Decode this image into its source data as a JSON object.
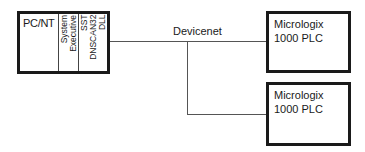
{
  "diagram": {
    "pc": {
      "title": "PC/NT",
      "column1": [
        "System",
        "Executive"
      ],
      "column2": [
        "SST",
        "DNSCAN32",
        "DLL"
      ]
    },
    "network": {
      "label": "Devicenet"
    },
    "plcs": [
      {
        "line1": "Micrologix",
        "line2": "1000 PLC"
      },
      {
        "line1": "Micrologix",
        "line2": "1000 PLC"
      }
    ]
  }
}
